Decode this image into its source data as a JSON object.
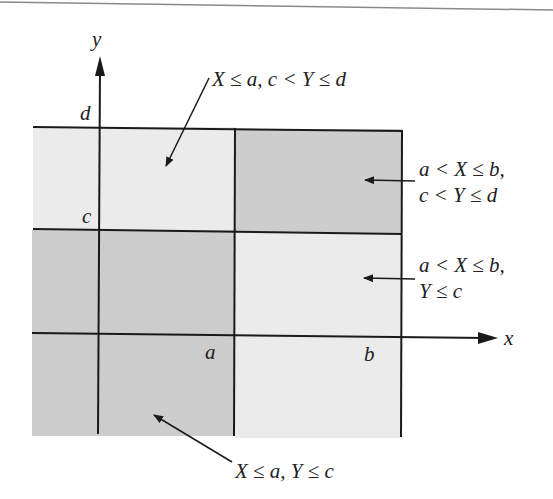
{
  "diagram": {
    "type": "joint distribution region partition",
    "colors": {
      "light_region": "#ebebeb",
      "dark_region": "#cdcdcd",
      "lines": "#1a1a1a",
      "text": "#222222"
    },
    "axes": {
      "x_label": "x",
      "y_label": "y"
    },
    "ticks": {
      "a": "a",
      "b": "b",
      "c": "c",
      "d": "d"
    },
    "labels": {
      "top": "X ≤ a, c < Y ≤ d",
      "right_upper_line1": "a < X ≤ b,",
      "right_upper_line2": "c < Y ≤ d",
      "right_lower_line1": "a < X ≤ b,",
      "right_lower_line2": "Y ≤ c",
      "bottom": "X ≤ a, Y ≤ c"
    },
    "regions": [
      {
        "name": "X ≤ a, c < Y ≤ d",
        "shade": "light"
      },
      {
        "name": "a < X ≤ b, c < Y ≤ d",
        "shade": "dark"
      },
      {
        "name": "X ≤ a, Y ≤ c",
        "shade": "dark"
      },
      {
        "name": "a < X ≤ b, Y ≤ c",
        "shade": "light"
      }
    ]
  }
}
